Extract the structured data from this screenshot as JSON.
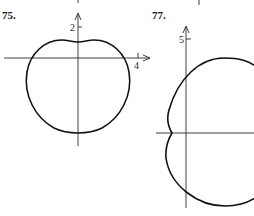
{
  "figures": [
    {
      "id": "75",
      "label": "75.",
      "y_tick_label": "2",
      "x_tick_label": "4",
      "description": "Polar curve with a small indentation at the top, resembling an apple/limaçon shape"
    },
    {
      "id": "77",
      "label": "77.",
      "y_tick_label": "5",
      "description": "Polar curve with a small indentation on the left at the x-axis, partially cropped on the right"
    }
  ],
  "colors": {
    "curve": "#111111",
    "axis": "#2b2b2b",
    "background": "#ffffff"
  }
}
